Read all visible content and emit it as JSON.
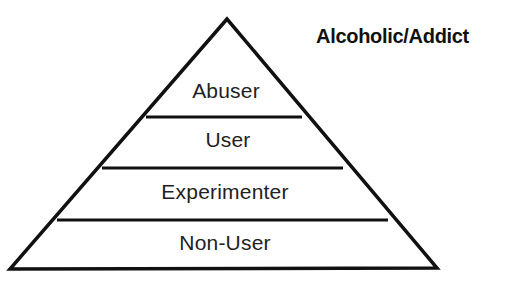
{
  "diagram": {
    "type": "pyramid",
    "apex_label": "Alcoholic/Addict",
    "levels": [
      {
        "label": "Abuser"
      },
      {
        "label": "User"
      },
      {
        "label": "Experimenter"
      },
      {
        "label": "Non-User"
      }
    ],
    "line_color": "#111111",
    "background": "#ffffff"
  }
}
